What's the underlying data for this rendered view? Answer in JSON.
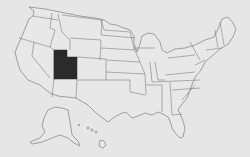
{
  "map": {
    "title": "United States map",
    "highlighted_state": "Utah",
    "colors": {
      "background": "#e6e6e6",
      "state_fill": "#e8e8e8",
      "border": "#6b6b6b",
      "highlight": "#2b2b2b"
    },
    "states_shown": [
      "Contiguous United States",
      "Alaska",
      "Hawaii"
    ]
  }
}
